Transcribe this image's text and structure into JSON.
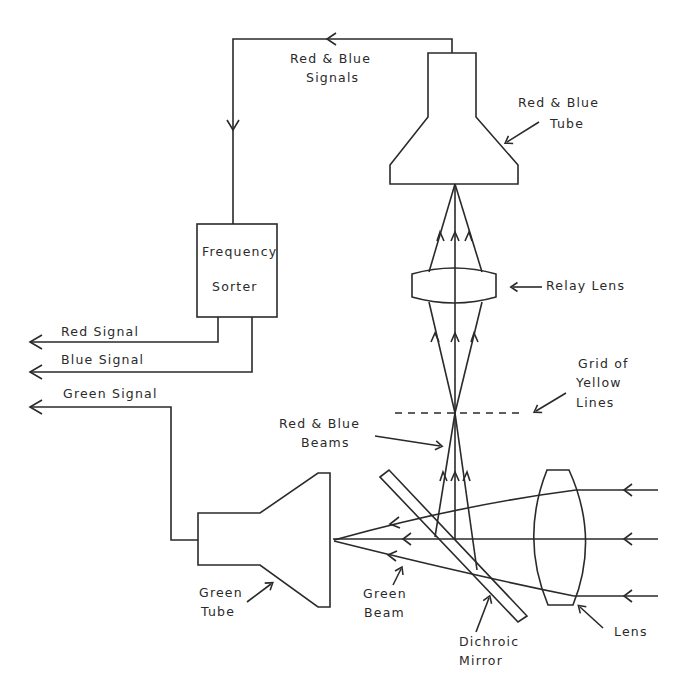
{
  "diagram": {
    "type": "optical schematic",
    "components": {
      "red_blue_tube": "Red & Blue Tube",
      "relay_lens": "Relay Lens",
      "grid": "Grid of Yellow Lines",
      "dichroic_mirror": "Dichroic Mirror",
      "lens": "Lens",
      "green_tube": "Green Tube",
      "frequency_sorter": "Frequency Sorter"
    },
    "labels": {
      "rb_signals_1": "Red & Blue",
      "rb_signals_2": "Signals",
      "rb_tube_1": "Red & Blue",
      "rb_tube_2": "Tube",
      "freq_1": "Frequency",
      "freq_2": "Sorter",
      "relay_lens": "Relay Lens",
      "red_signal": "Red Signal",
      "blue_signal": "Blue Signal",
      "green_signal": "Green Signal",
      "grid_1": "Grid of",
      "grid_2": "Yellow",
      "grid_3": "Lines",
      "rb_beams_1": "Red & Blue",
      "rb_beams_2": "Beams",
      "green_tube_1": "Green",
      "green_tube_2": "Tube",
      "green_beam_1": "Green",
      "green_beam_2": "Beam",
      "dichroic_1": "Dichroic",
      "dichroic_2": "Mirror",
      "lens": "Lens"
    },
    "connections": [
      {
        "from": "Red & Blue Tube",
        "to": "Frequency Sorter",
        "label": "Red & Blue Signals"
      },
      {
        "from": "Frequency Sorter",
        "to": "output",
        "label": "Red Signal"
      },
      {
        "from": "Frequency Sorter",
        "to": "output",
        "label": "Blue Signal"
      },
      {
        "from": "Green Tube",
        "to": "output",
        "label": "Green Signal"
      },
      {
        "from": "Lens",
        "to": "Dichroic Mirror",
        "label": "incoming light"
      },
      {
        "from": "Dichroic Mirror",
        "to": "Green Tube",
        "label": "Green Beam"
      },
      {
        "from": "Dichroic Mirror",
        "to": "Red & Blue Tube",
        "label": "Red & Blue Beams",
        "via": [
          "Grid of Yellow Lines",
          "Relay Lens"
        ]
      }
    ]
  }
}
